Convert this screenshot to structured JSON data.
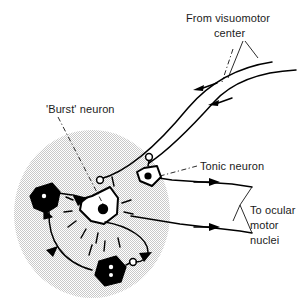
{
  "figure": {
    "background_color": "#ffffff",
    "ink_color": "#000000",
    "shaded_region_color": "#dcdcdc"
  },
  "labels": {
    "input_source_line1": "From visuomotor",
    "input_source_line2": "center",
    "burst_neuron": "'Burst' neuron",
    "tonic_neuron": "Tonic neuron",
    "output_line1": "To ocular",
    "output_line2": "motor",
    "output_line3": "nuclei"
  },
  "elements": {
    "shaded_nucleus_region": "shaded-circle",
    "afferent_axon_upper": "afferent-axon-upper",
    "afferent_axon_lower": "afferent-axon-lower",
    "efferent_axon_upper": "efferent-axon-upper",
    "efferent_axon_lower": "efferent-axon-lower",
    "burst_neuron_soma": "burst-neuron-soma",
    "tonic_neuron_soma": "tonic-neuron-soma",
    "inhibitory_neuron_left": "inhibitory-neuron-left",
    "inhibitory_neuron_bottom": "inhibitory-neuron-bottom",
    "recurrent_loop": "recurrent-inhibition-loop"
  },
  "icons": {
    "arrow_flow_in": "arrow-left-icon",
    "arrow_flow_out": "arrow-right-icon",
    "synapse_bouton": "open-circle-bouton-icon",
    "excitatory_terminal": "filled-triangle-synapse-icon",
    "brace": "curly-brace-icon"
  },
  "flow": {
    "afferent_direction": "left",
    "efferent_direction": "right",
    "afferent_arrow_count": 2,
    "efferent_arrow_count": 2
  }
}
